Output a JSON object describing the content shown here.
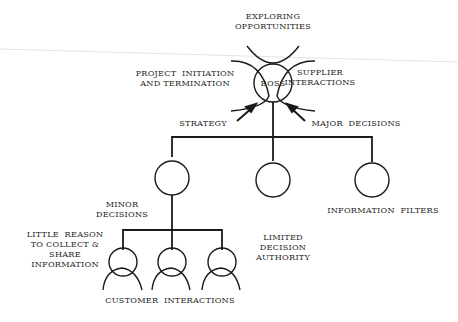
{
  "diagram": {
    "type": "organizational-hierarchy",
    "colors": {
      "stroke": "#1a1a1a",
      "text": "#1f1f1f",
      "background": "#ffffff",
      "scan_line": "#d4d4d4"
    },
    "nodes": {
      "boss": {
        "label": "BOSS"
      },
      "middle_managers": [
        "",
        "",
        ""
      ],
      "workers": [
        "",
        "",
        ""
      ]
    },
    "labels": {
      "exploring": "EXPLORING\nOPPORTUNITIES",
      "project": "PROJECT  INITIATION\nAND TERMINATION",
      "supplier": "SUPPLIER\nINTERACTIONS",
      "strategy": "STRATEGY",
      "major": "MAJOR  DECISIONS",
      "minor": "MINOR\nDECISIONS",
      "info_filters": "INFORMATION  FILTERS",
      "little_reason": "LITTLE  REASON\nTO COLLECT &\nSHARE\nINFORMATION",
      "limited": "LIMITED\nDECISION\nAUTHORITY",
      "customer": "CUSTOMER  INTERACTIONS"
    }
  }
}
